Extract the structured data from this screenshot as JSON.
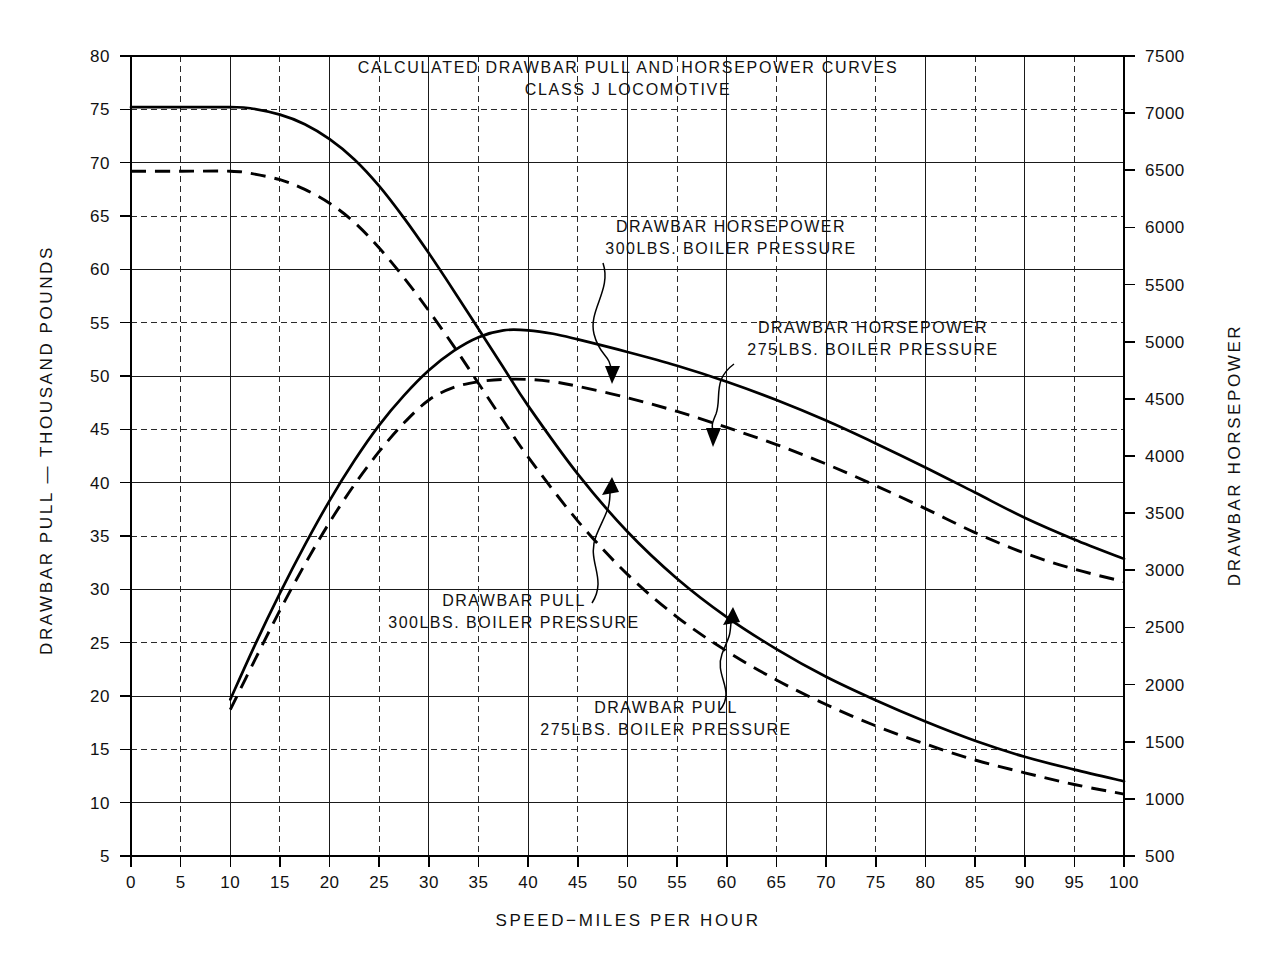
{
  "figure": {
    "title_line1": "CALCULATED DRAWBAR PULL AND HORSEPOWER CURVES",
    "title_line2": "CLASS J LOCOMOTIVE",
    "background_color": "#ffffff",
    "ink_color": "#000000"
  },
  "axes": {
    "left_title": "DRAWBAR PULL — THOUSAND POUNDS",
    "right_title": "DRAWBAR HORSEPOWER",
    "bottom_title": "SPEED−MILES PER HOUR",
    "left_ticks": [
      "5",
      "10",
      "15",
      "20",
      "25",
      "30",
      "35",
      "40",
      "45",
      "50",
      "55",
      "60",
      "65",
      "70",
      "75",
      "80"
    ],
    "right_ticks": [
      "500",
      "1000",
      "1500",
      "2000",
      "2500",
      "3000",
      "3500",
      "4000",
      "4500",
      "5000",
      "5500",
      "6000",
      "6500",
      "7000",
      "7500"
    ],
    "bottom_ticks": [
      "0",
      "5",
      "10",
      "15",
      "20",
      "25",
      "30",
      "35",
      "40",
      "45",
      "50",
      "55",
      "60",
      "65",
      "70",
      "75",
      "80",
      "85",
      "90",
      "95",
      "100"
    ]
  },
  "annotations": [
    {
      "id": "hp300",
      "line1": "DRAWBAR HORSEPOWER",
      "line2": "300LBS. BOILER PRESSURE"
    },
    {
      "id": "hp275",
      "line1": "DRAWBAR HORSEPOWER",
      "line2": "275LBS. BOILER PRESSURE"
    },
    {
      "id": "pull300",
      "line1": "DRAWBAR PULL",
      "line2": "300LBS. BOILER PRESSURE"
    },
    {
      "id": "pull275",
      "line1": "DRAWBAR PULL",
      "line2": "275LBS. BOILER PRESSURE"
    }
  ],
  "chart_data": {
    "type": "line",
    "xlabel": "SPEED-MILES PER HOUR",
    "ylabel": "DRAWBAR PULL - THOUSAND POUNDS",
    "y2label": "DRAWBAR HORSEPOWER",
    "xlim": [
      0,
      100
    ],
    "ylim": [
      5,
      80
    ],
    "y2lim": [
      500,
      7500
    ],
    "xticks": [
      0,
      5,
      10,
      15,
      20,
      25,
      30,
      35,
      40,
      45,
      50,
      55,
      60,
      65,
      70,
      75,
      80,
      85,
      90,
      95,
      100
    ],
    "yticks": [
      5,
      10,
      15,
      20,
      25,
      30,
      35,
      40,
      45,
      50,
      55,
      60,
      65,
      70,
      75,
      80
    ],
    "y2ticks": [
      500,
      1000,
      1500,
      2000,
      2500,
      3000,
      3500,
      4000,
      4500,
      5000,
      5500,
      6000,
      6500,
      7000,
      7500
    ],
    "grid": true,
    "legend": "inline-annotations",
    "series": [
      {
        "name": "DRAWBAR PULL 300LBS. BOILER PRESSURE",
        "axis": "left",
        "units": "thousand pounds",
        "style": "solid",
        "x": [
          0,
          5,
          10,
          12,
          15,
          17.5,
          20,
          22.5,
          25,
          27.5,
          30,
          32.5,
          35,
          37.5,
          40,
          45,
          50,
          55,
          60,
          65,
          70,
          75,
          80,
          85,
          90,
          95,
          100
        ],
        "y": [
          75.2,
          75.2,
          75.2,
          75.1,
          74.5,
          73.6,
          72.2,
          70.3,
          67.8,
          64.8,
          61.5,
          58.0,
          54.4,
          50.8,
          47.2,
          40.8,
          35.4,
          31.0,
          27.4,
          24.4,
          21.8,
          19.6,
          17.6,
          15.8,
          14.3,
          13.1,
          12.0
        ]
      },
      {
        "name": "DRAWBAR PULL 275LBS. BOILER PRESSURE",
        "axis": "left",
        "units": "thousand pounds",
        "style": "dashed",
        "x": [
          0,
          5,
          10,
          12,
          15,
          17.5,
          20,
          22.5,
          25,
          27.5,
          30,
          32.5,
          35,
          37.5,
          40,
          45,
          50,
          55,
          60,
          65,
          70,
          75,
          80,
          85,
          90,
          95,
          100
        ],
        "y": [
          69.2,
          69.2,
          69.2,
          69.0,
          68.4,
          67.5,
          66.2,
          64.4,
          62.0,
          59.2,
          56.1,
          52.8,
          49.3,
          45.8,
          42.4,
          36.4,
          31.4,
          27.4,
          24.2,
          21.5,
          19.2,
          17.2,
          15.5,
          14.0,
          12.8,
          11.7,
          10.8
        ]
      },
      {
        "name": "DRAWBAR HORSEPOWER 300LBS. BOILER PRESSURE",
        "axis": "right",
        "units": "horsepower",
        "style": "solid",
        "x": [
          10,
          12.5,
          15,
          17.5,
          20,
          22.5,
          25,
          27.5,
          30,
          32.5,
          35,
          37.5,
          40,
          42.5,
          45,
          50,
          55,
          60,
          65,
          70,
          75,
          80,
          85,
          90,
          95,
          100
        ],
        "y": [
          1870,
          2350,
          2800,
          3220,
          3610,
          3960,
          4270,
          4530,
          4750,
          4920,
          5040,
          5100,
          5100,
          5070,
          5020,
          4910,
          4790,
          4650,
          4490,
          4310,
          4110,
          3900,
          3680,
          3460,
          3270,
          3100
        ]
      },
      {
        "name": "DRAWBAR HORSEPOWER 275LBS. BOILER PRESSURE",
        "axis": "right",
        "units": "horsepower",
        "style": "dashed",
        "x": [
          10,
          12.5,
          15,
          17.5,
          20,
          22.5,
          25,
          27.5,
          30,
          32.5,
          35,
          37.5,
          40,
          42.5,
          45,
          50,
          55,
          60,
          65,
          70,
          75,
          80,
          85,
          90,
          95,
          100
        ],
        "y": [
          1780,
          2220,
          2650,
          3050,
          3420,
          3750,
          4040,
          4290,
          4490,
          4600,
          4650,
          4670,
          4670,
          4650,
          4610,
          4510,
          4390,
          4250,
          4100,
          3930,
          3740,
          3540,
          3330,
          3150,
          3010,
          2900
        ]
      }
    ]
  }
}
